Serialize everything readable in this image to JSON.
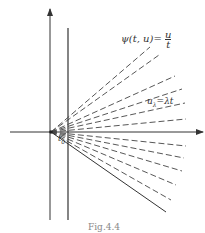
{
  "diagram": {
    "labels": {
      "psi_lhs": "ψ(t, u)=",
      "psi_num": "u",
      "psi_den": "t",
      "ray": "u",
      "ray_sub": "λ",
      "ray_rhs": "=λt",
      "t0": "t",
      "t0_sub": "0"
    },
    "caption": "Fig.4.4",
    "colors": {
      "stroke": "#333333",
      "background": "#ffffff"
    }
  }
}
